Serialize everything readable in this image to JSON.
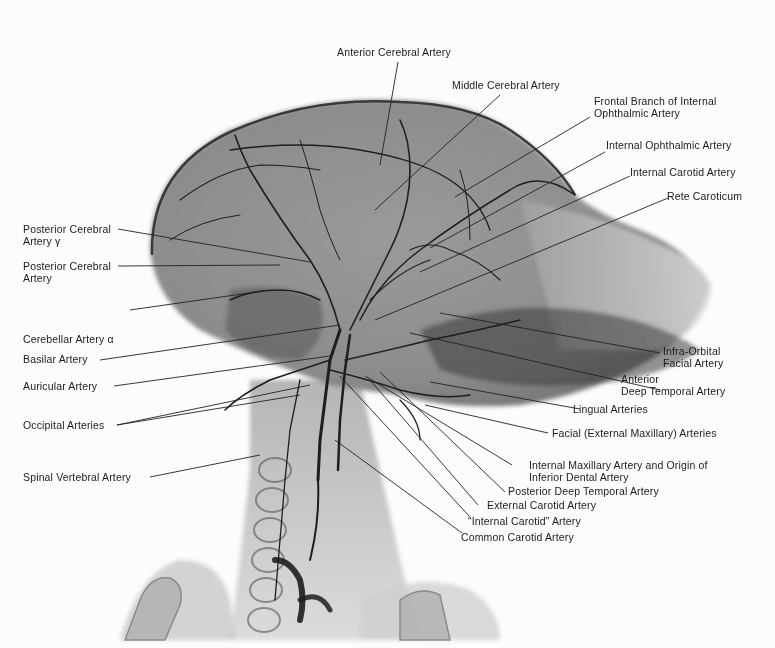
{
  "figure": {
    "type": "angiograph",
    "colors": {
      "background": "#fcfcfc",
      "tissue": "#8a8a8a",
      "vessel": "#1e1e1e",
      "label_text": "#1b1b1b",
      "leader_line": "#222222"
    }
  },
  "labels": {
    "top": [
      {
        "id": "anterior-cerebral",
        "lines": [
          "Anterior Cerebral Artery"
        ]
      },
      {
        "id": "middle-cerebral",
        "lines": [
          "Middle Cerebral Artery"
        ]
      }
    ],
    "right": [
      {
        "id": "frontal-branch",
        "lines": [
          "Frontal  Branch of Internal",
          "Ophthalmic Artery"
        ]
      },
      {
        "id": "internal-ophthalmic",
        "lines": [
          "Internal Ophthalmic  Artery"
        ]
      },
      {
        "id": "internal-carotid",
        "lines": [
          "Internal Carotid Artery"
        ]
      },
      {
        "id": "rete-caroticum",
        "lines": [
          "Rete Caroticum"
        ]
      },
      {
        "id": "infra-orbital",
        "lines": [
          "Infra-Orbital",
          "Facial Artery"
        ]
      },
      {
        "id": "anterior-deep-temporal",
        "lines": [
          "Anterior",
          "Deep  Temporal Artery"
        ]
      },
      {
        "id": "lingual",
        "lines": [
          "Lingual  Arteries"
        ]
      },
      {
        "id": "facial-external-maxillary",
        "lines": [
          "Facial (External Maxillary) Arteries"
        ]
      },
      {
        "id": "internal-maxillary",
        "lines": [
          "Internal Maxillary  Artery and Origin of",
          "Inferior Dental  Artery"
        ]
      },
      {
        "id": "posterior-deep-temporal",
        "lines": [
          "Posterior Deep Temporal  Artery"
        ]
      },
      {
        "id": "external-carotid",
        "lines": [
          "External  Carotid Artery"
        ]
      },
      {
        "id": "internal-carotid-quoted",
        "lines": [
          "“Internal Carotid” Artery"
        ]
      },
      {
        "id": "common-carotid",
        "lines": [
          "Common Carotid Artery"
        ]
      }
    ],
    "left": [
      {
        "id": "posterior-cerebral-gamma",
        "lines": [
          "Posterior  Cerebral",
          "Artery γ"
        ]
      },
      {
        "id": "posterior-cerebral",
        "lines": [
          "Posterior  Cerebral",
          "Artery"
        ]
      },
      {
        "id": "cerebellar-alpha",
        "lines": [
          "Cerebellar  Artery α"
        ]
      },
      {
        "id": "basilar",
        "lines": [
          "Basilar  Artery"
        ]
      },
      {
        "id": "auricular",
        "lines": [
          "Auricular  Artery"
        ]
      },
      {
        "id": "occipital",
        "lines": [
          "Occipital  Arteries"
        ]
      },
      {
        "id": "spinal-vertebral",
        "lines": [
          "Spinal  Vertebral  Artery"
        ]
      }
    ]
  }
}
